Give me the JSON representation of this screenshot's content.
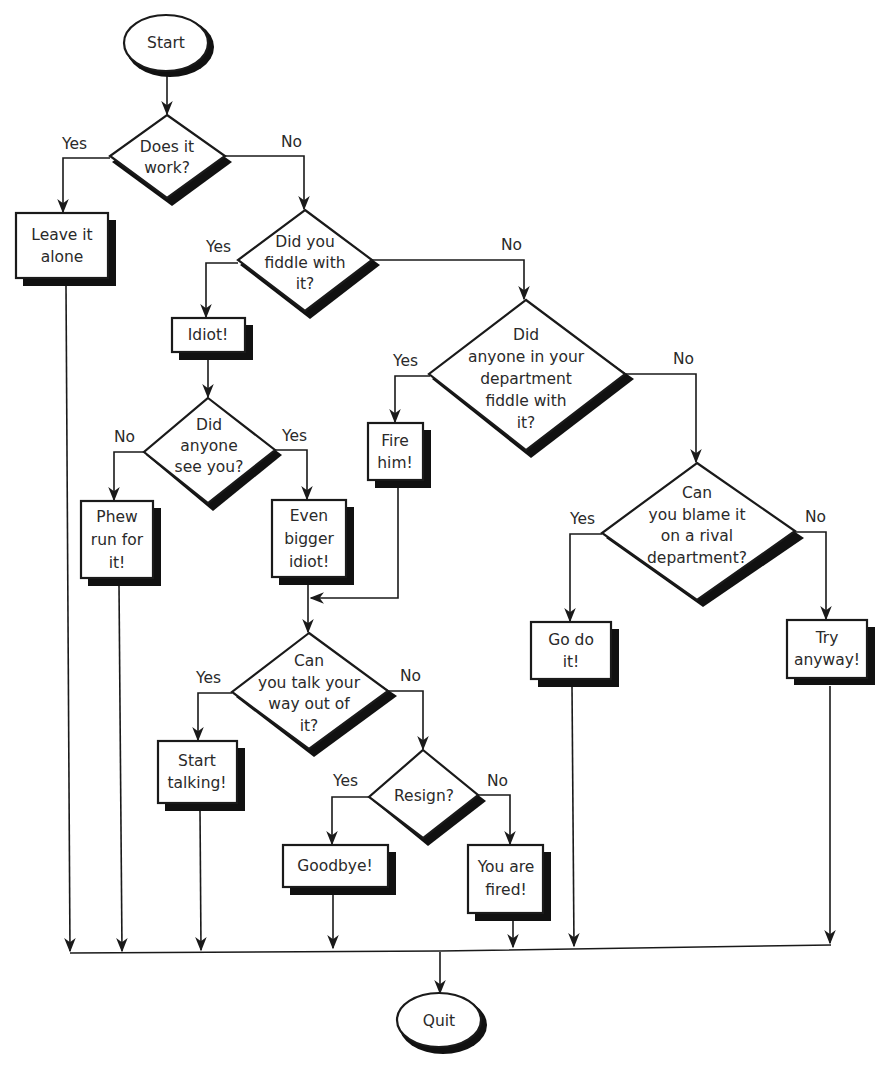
{
  "title": "",
  "nodes": {
    "start": "Start",
    "does_it_work": [
      "Does it",
      "work?"
    ],
    "leave_it": [
      "Leave it",
      "alone"
    ],
    "did_you_fiddle": [
      "Did you",
      "fiddle with",
      "it?"
    ],
    "idiot": "Idiot!",
    "did_anyone_dept": [
      "Did",
      "anyone in your",
      "department",
      "fiddle with",
      "it?"
    ],
    "did_anyone_see": [
      "Did",
      "anyone",
      "see you?"
    ],
    "phew": [
      "Phew",
      "run for",
      "it!"
    ],
    "even_bigger": [
      "Even",
      "bigger",
      "idiot!"
    ],
    "fire_him": [
      "Fire",
      "him!"
    ],
    "can_blame": [
      "Can",
      "you blame it",
      "on a rival",
      "department?"
    ],
    "go_do_it": [
      "Go do",
      "it!"
    ],
    "try_anyway": [
      "Try",
      "anyway!"
    ],
    "talk_way_out": [
      "Can",
      "you talk your",
      "way out of",
      "it?"
    ],
    "start_talking": [
      "Start",
      "talking!"
    ],
    "resign": "Resign?",
    "goodbye": "Goodbye!",
    "you_are_fired": [
      "You are",
      "fired!"
    ],
    "quit": "Quit"
  },
  "edge_labels": {
    "work_yes": "Yes",
    "work_no": "No",
    "fiddle_yes": "Yes",
    "fiddle_no": "No",
    "dept_yes": "Yes",
    "dept_no": "No",
    "see_no": "No",
    "see_yes": "Yes",
    "blame_yes": "Yes",
    "blame_no": "No",
    "talk_yes": "Yes",
    "talk_no": "No",
    "resign_yes": "Yes",
    "resign_no": "No"
  }
}
